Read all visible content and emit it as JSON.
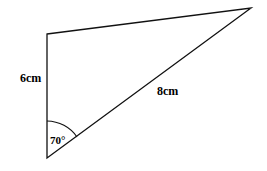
{
  "diagram": {
    "type": "triangle",
    "vertices": {
      "top_left": [
        47,
        34
      ],
      "top_right": [
        251,
        8
      ],
      "bottom": [
        47,
        158
      ]
    },
    "labels": {
      "left_side": "6cm",
      "hypotenuse_side": "8cm",
      "angle": "70°"
    },
    "stroke_color": "#000000"
  }
}
